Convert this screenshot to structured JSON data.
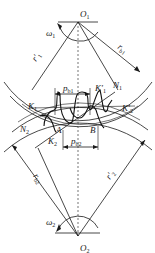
{
  "figure": {
    "type": "gear-meshing-diagram",
    "colors": {
      "line": "#1a1a1a",
      "background": "#ffffff"
    }
  },
  "labels": {
    "O1": {
      "main": "O",
      "sub": "1"
    },
    "O2": {
      "main": "O",
      "sub": "2"
    },
    "omega1": {
      "main": "ω",
      "sub": "1"
    },
    "omega2": {
      "main": "ω",
      "sub": "2"
    },
    "rb1": {
      "main": "r",
      "sub": "b1"
    },
    "rb2": {
      "main": "r",
      "sub": "b2"
    },
    "r1prime": {
      "main": "r′",
      "sub": "1"
    },
    "r2prime": {
      "main": "r′",
      "sub": "2"
    },
    "pb1": {
      "main": "p",
      "sub": "b1"
    },
    "pb2": {
      "main": "p",
      "sub": "b2"
    },
    "K1": {
      "main": "K",
      "sub": "1"
    },
    "K1prime": {
      "main": "K′",
      "sub": "1"
    },
    "K2": {
      "main": "K",
      "sub": "2"
    },
    "K2prime": {
      "main": "K′",
      "sub": "2"
    },
    "N1": {
      "main": "N",
      "sub": "1"
    },
    "N2": {
      "main": "N",
      "sub": "2"
    },
    "A": {
      "main": "A"
    },
    "B": {
      "main": "B"
    }
  }
}
